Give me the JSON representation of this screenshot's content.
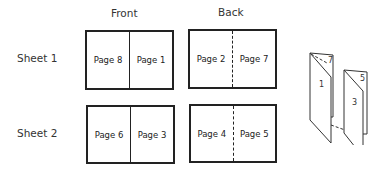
{
  "columns": {
    "front": "Front",
    "back": "Back"
  },
  "rows": [
    {
      "label": "Sheet 1",
      "front": {
        "left": "Page 8",
        "right": "Page 1"
      },
      "back": {
        "left": "Page 2",
        "right": "Page 7"
      }
    },
    {
      "label": "Sheet 2",
      "front": {
        "left": "Page 6",
        "right": "Page 3"
      },
      "back": {
        "left": "Page 4",
        "right": "Page 5"
      }
    }
  ],
  "booklet": {
    "page_labels": [
      "7",
      "1",
      "5",
      "3"
    ]
  }
}
